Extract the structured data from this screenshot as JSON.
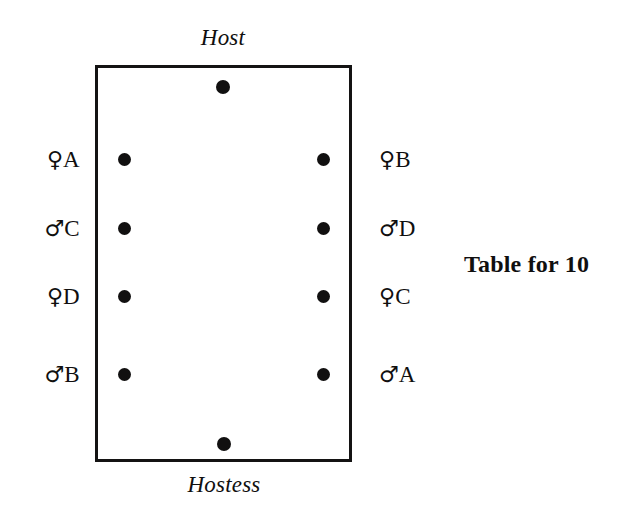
{
  "figure": {
    "caption": "Table for 10",
    "background_color": "#ffffff",
    "ink_color": "#111010",
    "shape": "rectangular-table"
  },
  "ends": {
    "top": {
      "label": "Host",
      "style": "italic"
    },
    "bottom": {
      "label": "Hostess",
      "style": "italic"
    }
  },
  "seats": {
    "head_count": 2,
    "side_count": 8,
    "total": 10,
    "left_side": [
      {
        "symbol": "♀",
        "gender": "female",
        "letter": "A",
        "label": "♀A"
      },
      {
        "symbol": "♂",
        "gender": "male",
        "letter": "C",
        "label": "♂C"
      },
      {
        "symbol": "♀",
        "gender": "female",
        "letter": "D",
        "label": "♀D"
      },
      {
        "symbol": "♂",
        "gender": "male",
        "letter": "B",
        "label": "♂B"
      }
    ],
    "right_side": [
      {
        "symbol": "♀",
        "gender": "female",
        "letter": "B",
        "label": "♀B"
      },
      {
        "symbol": "♂",
        "gender": "male",
        "letter": "D",
        "label": "♂D"
      },
      {
        "symbol": "♀",
        "gender": "female",
        "letter": "C",
        "label": "♀C"
      },
      {
        "symbol": "♂",
        "gender": "male",
        "letter": "A",
        "label": "♂A"
      }
    ]
  }
}
